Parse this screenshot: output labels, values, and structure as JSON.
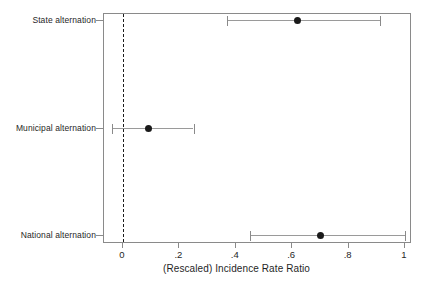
{
  "chart_data": {
    "type": "scatter",
    "subtype": "coefficient-plot-with-error-bars",
    "title": "",
    "xlabel": "(Rescaled) Incidence Rate Ratio",
    "ylabel": "",
    "xlim": [
      -0.065,
      1.025
    ],
    "xticks": [
      0,
      0.2,
      0.4,
      0.6,
      0.8,
      1
    ],
    "xticklabels": [
      "0",
      ".2",
      ".4",
      ".6",
      ".8",
      "1"
    ],
    "grid": false,
    "legend": null,
    "reference_line": {
      "value": 0,
      "style": "dashed",
      "color": "#1c1c1c",
      "orientation": "vertical"
    },
    "categories": [
      "State alternation",
      "Municipal alternation",
      "National alternation"
    ],
    "points": [
      {
        "label": "State alternation",
        "estimate": 0.62,
        "ci_low": 0.37,
        "ci_high": 0.91,
        "row": 0
      },
      {
        "label": "Municipal alternation",
        "estimate": 0.09,
        "ci_low": -0.04,
        "ci_high": 0.25,
        "row": 1
      },
      {
        "label": "National alternation",
        "estimate": 0.7,
        "ci_low": 0.45,
        "ci_high": 1.0,
        "row": 2
      }
    ],
    "marker_color": "#1a1a1a",
    "ci_color": "#9a9a9a",
    "frame_color": "#8a8a8a",
    "background_color": "#ffffff"
  }
}
